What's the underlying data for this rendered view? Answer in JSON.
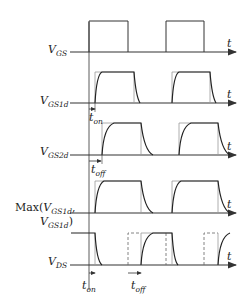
{
  "diagram": {
    "type": "timing-diagram",
    "colors": {
      "stroke": "#333333",
      "ideal": "#999999",
      "background": "#ffffff"
    },
    "axis_label": "t",
    "signals": [
      {
        "id": "vgs",
        "main": "V",
        "sub": "GS",
        "prefix": "",
        "suffix": ""
      },
      {
        "id": "vgs1d",
        "main": "V",
        "sub": "GS1d",
        "prefix": "",
        "suffix": ""
      },
      {
        "id": "vgs2d",
        "main": "V",
        "sub": "GS2d",
        "prefix": "",
        "suffix": ""
      },
      {
        "id": "max",
        "line1_prefix": "Max(",
        "line1_main": "V",
        "line1_sub": "GS1d",
        "line1_suffix": ",",
        "line2_main": "V",
        "line2_sub": "GS1d",
        "line2_suffix": ")"
      },
      {
        "id": "vds",
        "main": "V",
        "sub": "DS",
        "prefix": "",
        "suffix": ""
      }
    ],
    "annotations": {
      "t_on_1": {
        "main": "t",
        "sub": "on"
      },
      "t_off_1": {
        "main": "t",
        "sub": "off"
      },
      "t_on_2": {
        "main": "t",
        "sub": "on"
      },
      "t_off_2": {
        "main": "t",
        "sub": "off"
      }
    }
  }
}
